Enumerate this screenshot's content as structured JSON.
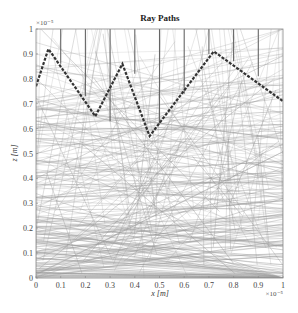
{
  "chart_data": {
    "type": "line",
    "title": "Ray Paths",
    "xlabel": "x [m]",
    "ylabel": "z [m]",
    "x_multiplier": "×10⁻⁵",
    "y_multiplier": "×10⁻⁵",
    "xlim": [
      0,
      1
    ],
    "ylim": [
      0,
      1
    ],
    "x_ticks": [
      "0",
      "0.1",
      "0.2",
      "0.3",
      "0.4",
      "0.5",
      "0.6",
      "0.7",
      "0.8",
      "0.9",
      "1"
    ],
    "y_ticks": [
      "0",
      "0.1",
      "0.2",
      "0.3",
      "0.4",
      "0.5",
      "0.6",
      "0.7",
      "0.8",
      "0.9",
      "1"
    ],
    "grid": false,
    "legend": null,
    "series": [
      {
        "name": "highlighted ray path",
        "style": "dashed",
        "color": "#333333",
        "x": [
          0.0,
          0.05,
          0.24,
          0.35,
          0.46,
          0.72,
          1.0
        ],
        "y": [
          0.77,
          0.92,
          0.65,
          0.86,
          0.57,
          0.91,
          0.71
        ]
      },
      {
        "name": "vertical rays (from top boundary)",
        "style": "solid",
        "color": "#666666",
        "segments": [
          {
            "x": 0.1,
            "y_top": 1.0,
            "y_bottom": 0.86
          },
          {
            "x": 0.2,
            "y_top": 1.0,
            "y_bottom": 0.73
          },
          {
            "x": 0.3,
            "y_top": 1.0,
            "y_bottom": 0.63
          },
          {
            "x": 0.4,
            "y_top": 1.0,
            "y_bottom": 0.82
          },
          {
            "x": 0.5,
            "y_top": 1.0,
            "y_bottom": 0.62
          },
          {
            "x": 0.6,
            "y_top": 1.0,
            "y_bottom": 0.74
          },
          {
            "x": 0.7,
            "y_top": 1.0,
            "y_bottom": 0.9
          },
          {
            "x": 0.8,
            "y_top": 1.0,
            "y_bottom": 0.87
          },
          {
            "x": 0.9,
            "y_top": 1.0,
            "y_bottom": 0.81
          }
        ]
      },
      {
        "name": "background ray paths",
        "style": "solid",
        "color": "#9a9a9a",
        "description": "many random straight ray segments, densest below z≈0.6"
      }
    ]
  },
  "colors": {
    "background": "#ffffff",
    "axes": "#888888",
    "rays": "#9a9a9a",
    "vertical_rays": "#666666",
    "highlight": "#333333"
  }
}
